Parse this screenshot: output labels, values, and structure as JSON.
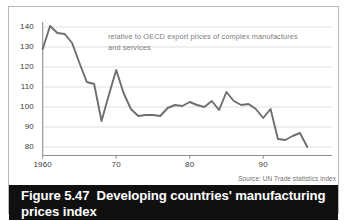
{
  "figure": {
    "number_label": "Figure 5.47",
    "title": "Developing countries' manufacturing prices index",
    "source_note": "Source: UN Trade statistics index",
    "annotation": "relative to OECD export prices of complex manufactures and services"
  },
  "chart_data": {
    "type": "line",
    "title": "Developing countries' manufacturing prices index",
    "subtitle": "relative to OECD export prices of complex manufactures and services",
    "xlabel": "",
    "ylabel": "",
    "xlim": [
      1960,
      1996
    ],
    "ylim": [
      74,
      143
    ],
    "grid": true,
    "grid_axis": "y",
    "legend": "none",
    "line_color": "#6e6e6e",
    "x_ticks": [
      1960,
      1970,
      1980,
      1990
    ],
    "x_tick_labels": [
      "1960",
      "70",
      "80",
      "90"
    ],
    "y_ticks": [
      80,
      90,
      100,
      110,
      120,
      130,
      140
    ],
    "y_tick_labels": [
      "80",
      "90",
      "100",
      "110",
      "120",
      "130",
      "140"
    ],
    "series": [
      {
        "name": "Developing countries' manufacturing prices index",
        "x": [
          1960,
          1961,
          1962,
          1963,
          1964,
          1965,
          1966,
          1967,
          1968,
          1969,
          1970,
          1971,
          1972,
          1973,
          1974,
          1975,
          1976,
          1977,
          1978,
          1979,
          1980,
          1981,
          1982,
          1983,
          1984,
          1985,
          1986,
          1987,
          1988,
          1989,
          1990,
          1991,
          1992,
          1993,
          1994,
          1995,
          1996
        ],
        "values": [
          129.0,
          140.5,
          137.0,
          136.5,
          132.0,
          122.0,
          112.5,
          111.5,
          93.0,
          106.0,
          118.5,
          107.0,
          99.0,
          95.5,
          96.0,
          96.0,
          95.5,
          99.5,
          101.0,
          100.5,
          102.5,
          101.0,
          100.0,
          103.0,
          98.5,
          107.5,
          103.0,
          101.0,
          101.5,
          99.0,
          94.5,
          99.0,
          84.0,
          83.5,
          85.5,
          87.0,
          80.0
        ]
      }
    ]
  }
}
